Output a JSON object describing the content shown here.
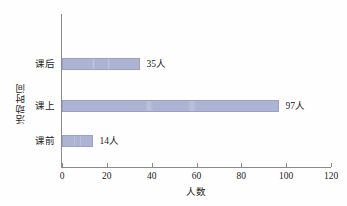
{
  "chart_data": {
    "type": "bar",
    "orientation": "horizontal",
    "title": "",
    "xlabel": "人数",
    "ylabel": "活动时间",
    "categories": [
      "课前",
      "课上",
      "课后"
    ],
    "values": [
      14,
      97,
      35
    ],
    "data_labels": [
      "14人",
      "97人",
      "35人"
    ],
    "xlim": [
      0,
      120
    ],
    "xticks": [
      0,
      20,
      40,
      60,
      80,
      100,
      120
    ],
    "xtick_labels": [
      "0",
      "20",
      "40",
      "60",
      "80",
      "100",
      "120"
    ],
    "grid": false,
    "legend": false,
    "bar_color": "#adb3d2",
    "bar_edge_color": "#9aa1c6",
    "axis_color": "#8a8a8a",
    "background": "#fefefe",
    "series": [
      {
        "name": "人数",
        "values": [
          14,
          97,
          35
        ]
      }
    ],
    "bars": [
      {
        "category": "课后",
        "value": 35,
        "label": "35人"
      },
      {
        "category": "课上",
        "value": 97,
        "label": "97人"
      },
      {
        "category": "课前",
        "value": 14,
        "label": "14人"
      }
    ]
  }
}
